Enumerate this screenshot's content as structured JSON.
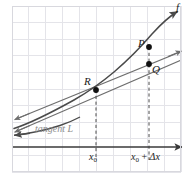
{
  "figure": {
    "type": "math-diagram",
    "topic": "derivative-secant-and-tangent-line",
    "labels": {
      "function_curve": "f",
      "point_p": "P",
      "point_q": "Q",
      "point_r": "R",
      "tangent_line": "tangent L",
      "x_axis_tick_left": "x",
      "x_axis_tick_left_sub": "0",
      "x_axis_tick_right": "x",
      "x_axis_tick_right_sub": "0",
      "x_axis_tick_right_op": " + ",
      "x_axis_tick_right_delta": "Δx"
    },
    "colors": {
      "grid": "#e3e3e8",
      "grid_strong": "#d2d2d8",
      "axis": "#3a3a3a",
      "curve": "#4a4a4a",
      "secant": "#6e6e6e",
      "tangent": "#6e6e6e",
      "dashed": "#4a4a4a",
      "point": "#111111",
      "label_text": "#1a1a1a",
      "tangent_label_text": "#8c8c8c",
      "background": "#ffffff"
    },
    "geometry": {
      "grid_left": 12,
      "grid_right": 181,
      "grid_top": 6,
      "grid_bottom": 172,
      "grid_step": 16.9,
      "axis_y": 147,
      "axis_arrow_x": 187,
      "x0_x": 96,
      "x0_plus_dx_x": 149,
      "point_p": [
        149,
        47
      ],
      "point_q": [
        149,
        64
      ],
      "point_r": [
        96,
        90
      ],
      "curve_label_pos": [
        178,
        8
      ],
      "secant_arrow_right": [
        181,
        52
      ],
      "curve_arrow_right": [
        180,
        11
      ],
      "tangent_arrow_left": [
        14,
        132
      ],
      "secant_arrow_left": [
        14,
        120
      ]
    }
  }
}
